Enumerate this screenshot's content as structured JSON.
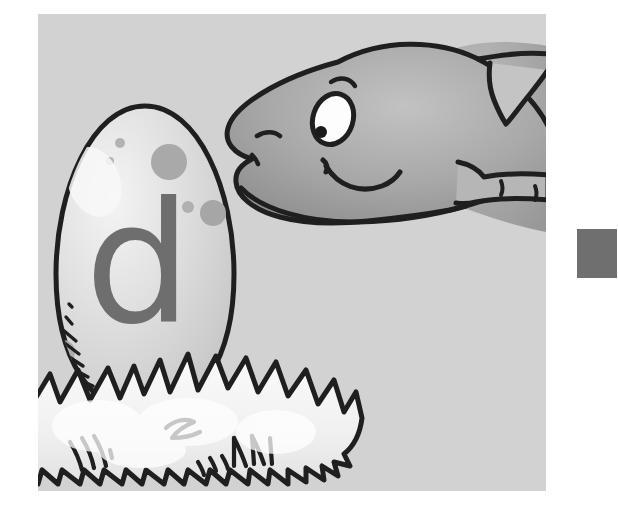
{
  "scene": {
    "title": "Dinosaur looking at egg with letter d in a nest",
    "kind": "childrens-alphabet-illustration",
    "letter": "d",
    "letter_color": "#6e6e6e",
    "panel": {
      "background_color": "#d2d2d2",
      "x": 38,
      "y": 14,
      "width": 508,
      "height": 477
    },
    "page_background": "#ffffff",
    "ink_color": "#1f1f1f"
  },
  "egg": {
    "label": "speckled dinosaur egg",
    "shell_color": "#dcdcdc",
    "shell_highlight": "#f2f2f2",
    "shell_shadow": "#c2c2c2",
    "outline_color": "#1f1f1f",
    "spots": [
      {
        "cx": 82,
        "cy": 129,
        "r": 5,
        "color": "#b3b3b3"
      },
      {
        "cx": 72,
        "cy": 147,
        "r": 4,
        "color": "#b5b5b5"
      },
      {
        "cx": 131,
        "cy": 148,
        "r": 18,
        "color": "#a9a9a9"
      },
      {
        "cx": 150,
        "cy": 193,
        "r": 6,
        "color": "#b0b0b0"
      },
      {
        "cx": 175,
        "cy": 199,
        "r": 13,
        "color": "#a6a6a6"
      },
      {
        "cx": 25,
        "cy": 338,
        "r": 12,
        "color": "#ababab"
      },
      {
        "cx": 7,
        "cy": 345,
        "r": 5,
        "color": "#b0b0b0"
      }
    ],
    "hatch_marks": 7
  },
  "nest": {
    "label": "straw nest",
    "fill_color": "#f7f7f7",
    "shade_color": "#dfdfdf",
    "outline_color": "#1f1f1f",
    "spike_count": 26
  },
  "dinosaur": {
    "label": "smiling dinosaur head",
    "body_color": "#a8a8a8",
    "body_highlight": "#c0c0c0",
    "body_shadow": "#8f8f8f",
    "outline_color": "#1f1f1f",
    "eye": {
      "sclera_color": "#fdfdfd",
      "pupil_color": "#1a1a1a",
      "label": "dinosaur-eye"
    },
    "features": [
      "eyebrow",
      "nostril",
      "smile-mouth",
      "neck-frill-spike",
      "front-leg",
      "leg-claw-marks"
    ]
  },
  "swatch": {
    "label": "gray color swatch",
    "color": "#6f6f6f",
    "x": 577,
    "y": 229,
    "width": 40,
    "height": 49
  }
}
